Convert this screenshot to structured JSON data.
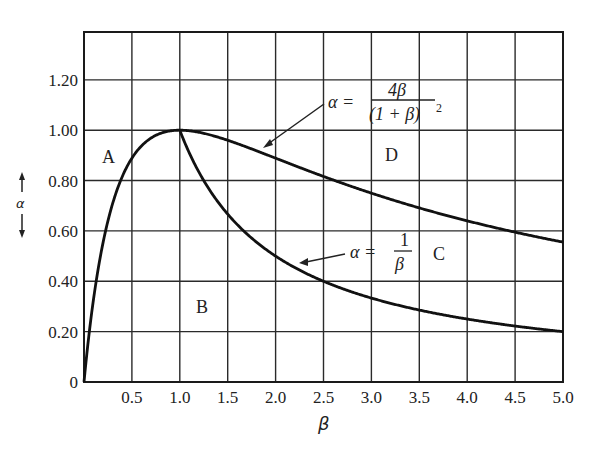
{
  "chart_data": {
    "type": "line",
    "title": "",
    "xlabel": "β",
    "ylabel": "α",
    "xlim": [
      0,
      5.0
    ],
    "ylim": [
      0,
      1.39
    ],
    "grid": true,
    "x_ticks": [
      "0.5",
      "1.0",
      "1.5",
      "2.0",
      "2.5",
      "3.0",
      "3.5",
      "4.0",
      "4.5",
      "5.0"
    ],
    "y_ticks": [
      "0",
      "0.20",
      "0.40",
      "0.60",
      "0.80",
      "1.00",
      "1.20"
    ],
    "series": [
      {
        "name": "α = 4β/(1+β)²",
        "x": [
          0.0,
          0.05,
          0.1,
          0.2,
          0.3,
          0.4,
          0.5,
          0.6,
          0.8,
          1.0,
          1.5,
          2.0,
          2.5,
          3.0,
          3.5,
          4.0,
          4.5,
          5.0
        ],
        "values": [
          0.0,
          0.181,
          0.331,
          0.556,
          0.71,
          0.816,
          0.889,
          0.938,
          0.988,
          1.0,
          0.96,
          0.889,
          0.816,
          0.75,
          0.691,
          0.64,
          0.595,
          0.556
        ]
      },
      {
        "name": "α = 1/β",
        "x": [
          1.0,
          1.25,
          1.5,
          2.0,
          2.5,
          3.0,
          3.5,
          4.0,
          4.5,
          5.0
        ],
        "values": [
          1.0,
          0.8,
          0.667,
          0.5,
          0.4,
          0.333,
          0.286,
          0.25,
          0.222,
          0.2
        ]
      }
    ],
    "annotations": [
      {
        "text": "A",
        "x": 0.3,
        "y": 0.87
      },
      {
        "text": "B",
        "x": 1.25,
        "y": 0.28
      },
      {
        "text": "C",
        "x": 3.75,
        "y": 0.48
      },
      {
        "text": "D",
        "x": 3.25,
        "y": 0.88
      },
      {
        "text": "α = 4β/(1+β)²",
        "arrow_to": [
          1.85,
          0.92
        ]
      },
      {
        "text": "α = 1/β",
        "arrow_to": [
          2.3,
          0.45
        ]
      }
    ]
  },
  "labels": {
    "x_axis": "β",
    "y_axis": "α",
    "region_a": "A",
    "region_b": "B",
    "region_c": "C",
    "region_d": "D",
    "eq1_lhs": "α =",
    "eq1_num": "4β",
    "eq1_den": "(1 + β)",
    "eq1_exp": "2",
    "eq2_lhs": "α =",
    "eq2_num": "1",
    "eq2_den": "β"
  }
}
